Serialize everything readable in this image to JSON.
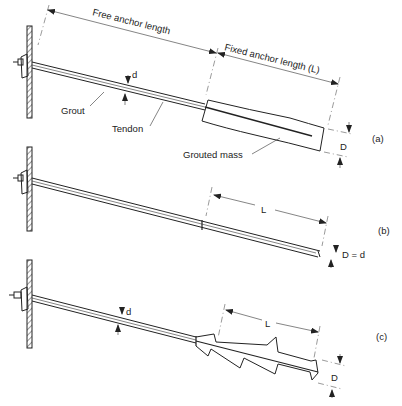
{
  "diagram": {
    "type": "ground anchor types",
    "colors": {
      "ink": "#222222",
      "background": "#ffffff"
    },
    "labels": {
      "free_anchor_length": "Free anchor length",
      "fixed_anchor_length": "Fixed anchor length (L)",
      "grout": "Grout",
      "tendon": "Tendon",
      "d_a": "d",
      "grouted_mass": "Grouted mass",
      "D_a": "D",
      "L_b": "L",
      "D_eq_d": "D = d",
      "d_c": "d",
      "L_c": "L",
      "D_c": "D"
    },
    "panels": [
      {
        "id": "a",
        "caption": "(a)",
        "description": "Anchor with enlarged grouted mass"
      },
      {
        "id": "b",
        "caption": "(b)",
        "description": "Anchor with fixed length equal to borehole diameter"
      },
      {
        "id": "c",
        "caption": "(c)",
        "description": "Anchor with under-reamed (serrated) fixed length"
      }
    ]
  }
}
